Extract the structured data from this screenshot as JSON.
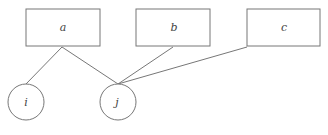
{
  "diagram": {
    "boxes": [
      {
        "id": "a",
        "label": "a"
      },
      {
        "id": "b",
        "label": "b"
      },
      {
        "id": "c",
        "label": "c"
      }
    ],
    "circles": [
      {
        "id": "i",
        "label": "i"
      },
      {
        "id": "j",
        "label": "j"
      }
    ],
    "edges": [
      {
        "from": "a",
        "to": "i"
      },
      {
        "from": "a",
        "to": "j"
      },
      {
        "from": "b",
        "to": "j"
      },
      {
        "from": "c",
        "to": "j"
      }
    ],
    "colors": {
      "stroke": "#777777",
      "text": "#444444",
      "background": "#ffffff"
    }
  }
}
